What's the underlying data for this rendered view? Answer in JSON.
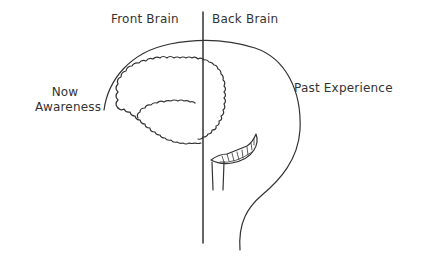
{
  "diagram": {
    "type": "brain-sagittal-sketch",
    "divider": "vertical line separating front and back halves of the brain",
    "labels": {
      "front_brain": "Front Brain",
      "back_brain": "Back Brain",
      "now_awareness_line1": "Now",
      "now_awareness_line2": "Awareness",
      "past_experience": "Past Experience"
    },
    "colors": {
      "stroke": "#333333",
      "background": "#ffffff"
    },
    "parts": [
      "outer-skull-outline",
      "cerebrum-outline",
      "inner-fold",
      "cerebellum",
      "brain-stem",
      "divider-line"
    ]
  }
}
